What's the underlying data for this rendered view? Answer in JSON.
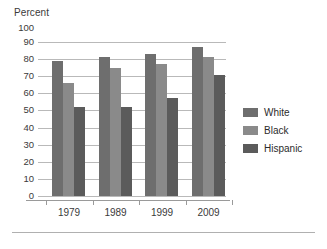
{
  "chart_data": {
    "type": "bar",
    "title": "",
    "ylabel": "Percent",
    "xlabel": "",
    "ylim": [
      0,
      100
    ],
    "ytick_step": 10,
    "ytick_labels": [
      "100",
      "90",
      "80",
      "70",
      "60",
      "50",
      "40",
      "30",
      "20",
      "10",
      "0"
    ],
    "grid": true,
    "gridlines_at": [
      90,
      80,
      70,
      60,
      50,
      40,
      30,
      20,
      10,
      0
    ],
    "legend_position": "right",
    "categories": [
      "1979",
      "1989",
      "1999",
      "2009"
    ],
    "series": [
      {
        "name": "White",
        "color": "#6e6e6e",
        "values": [
          79,
          81,
          83,
          87
        ]
      },
      {
        "name": "Black",
        "color": "#8a8a8a",
        "values": [
          66,
          75,
          77,
          81
        ]
      },
      {
        "name": "Hispanic",
        "color": "#5b5b5b",
        "values": [
          52,
          52,
          57,
          71
        ]
      }
    ]
  }
}
